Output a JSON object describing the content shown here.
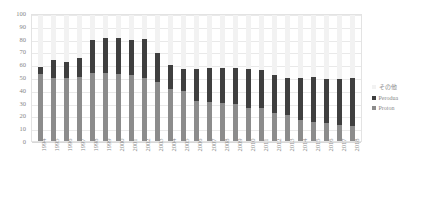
{
  "chart_data": {
    "type": "bar",
    "subtype": "stacked-column",
    "title": "",
    "xlabel": "",
    "ylabel": "",
    "ylim": [
      0,
      100
    ],
    "yticks": [
      0,
      10,
      20,
      30,
      40,
      50,
      60,
      70,
      80,
      90,
      100
    ],
    "ytick_labels": [
      "0",
      "10",
      "20",
      "30",
      "40",
      "50",
      "60",
      "70",
      "80",
      "90",
      "100"
    ],
    "grid": true,
    "legend_position": "right",
    "categories": [
      "1994",
      "1995",
      "1996",
      "1997",
      "1998",
      "1999",
      "2000",
      "2001",
      "2002",
      "2003",
      "2004",
      "2005",
      "2006",
      "2007",
      "2008",
      "2009",
      "2010",
      "2011",
      "2012",
      "2013",
      "2014",
      "2015",
      "2016",
      "2017",
      "2018"
    ],
    "series": [
      {
        "name": "Proton",
        "color": "#8c8c8c",
        "values": [
          53,
          50,
          50,
          51,
          54,
          54,
          53,
          52,
          50,
          47,
          41,
          40,
          32,
          31,
          30,
          29,
          26,
          26,
          22,
          21,
          17,
          15,
          14,
          13,
          12
        ]
      },
      {
        "name": "Perodua",
        "color": "#3f3f3f",
        "values": [
          6,
          14,
          13,
          15,
          26,
          28,
          29,
          28,
          31,
          23,
          19,
          17,
          25,
          27,
          28,
          29,
          31,
          30,
          30,
          29,
          33,
          36,
          35,
          36,
          38
        ]
      },
      {
        "name": "その他",
        "color": "#f2f2f2",
        "values": [
          41,
          36,
          37,
          34,
          20,
          18,
          18,
          20,
          19,
          30,
          40,
          43,
          43,
          42,
          42,
          42,
          43,
          44,
          48,
          50,
          50,
          49,
          51,
          51,
          50
        ]
      }
    ],
    "totals": [
      59,
      64,
      63,
      66,
      80,
      82,
      80,
      80,
      81,
      70,
      60,
      57,
      57,
      58,
      58,
      58,
      57,
      56,
      52,
      50,
      50,
      51,
      49,
      49,
      50
    ]
  },
  "legend": {
    "items": [
      {
        "label": "その他",
        "color": "#f2f2f2"
      },
      {
        "label": "Perodua",
        "color": "#3f3f3f"
      },
      {
        "label": "Proton",
        "color": "#8c8c8c"
      }
    ]
  }
}
